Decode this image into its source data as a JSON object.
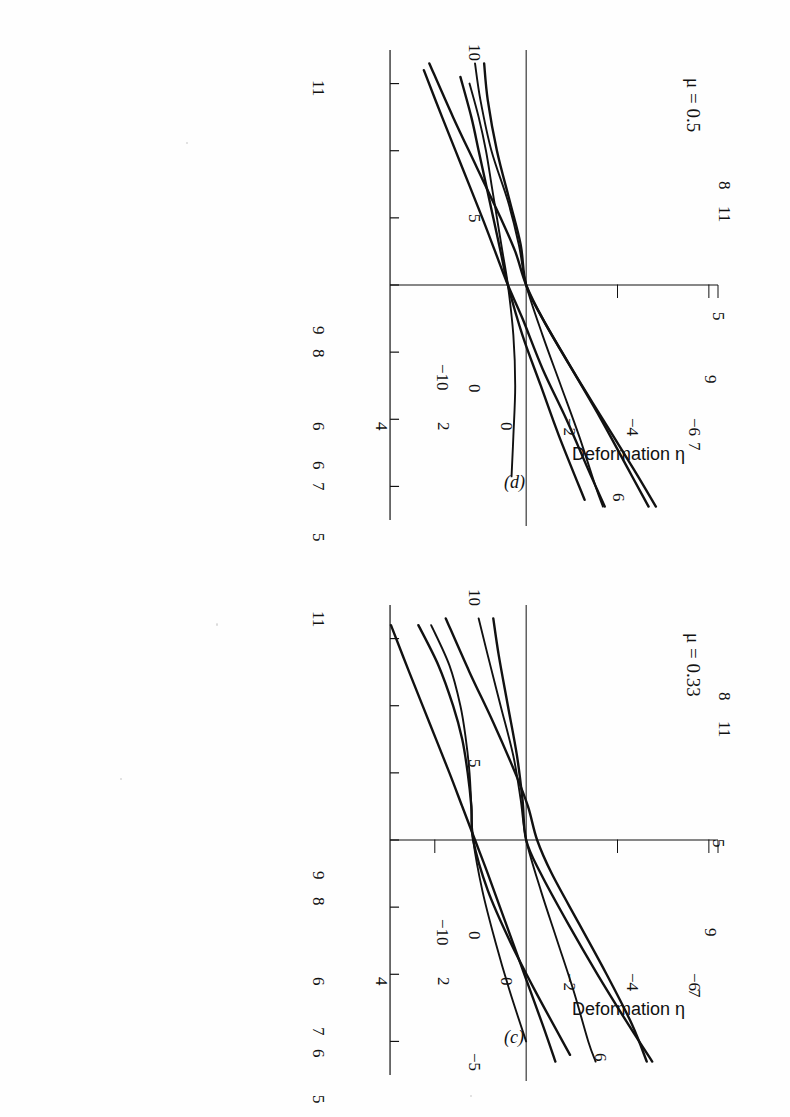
{
  "figure": {
    "orientation": "rotated-90-ccw",
    "background_color": "#fefefe",
    "ink_color": "#111111",
    "panels": [
      "c",
      "d"
    ]
  },
  "panel_c": {
    "tag": "(c)",
    "mu_label": "μ = 0.33",
    "xaxis_title": "Deformation η",
    "y_tick_labels": [
      "10",
      "5",
      "0",
      "−5"
    ],
    "x_tick_labels": [
      "−6",
      "−4",
      "−2",
      "0",
      "2",
      "4",
      "6"
    ],
    "y_minus_ten_label": "−10",
    "curve_labels_left": [
      "11",
      "9",
      "8",
      "7",
      "6",
      "5"
    ],
    "curve_labels_right": [
      "8",
      "11",
      "5",
      "9",
      "7",
      "6"
    ]
  },
  "panel_d": {
    "tag": "(d)",
    "mu_label": "μ = 0.5",
    "xaxis_title": "Deformation η",
    "y_tick_labels": [
      "10",
      "5",
      "0"
    ],
    "x_tick_labels": [
      "−6",
      "−4",
      "−2",
      "0",
      "2",
      "4",
      "6"
    ],
    "y_minus_ten_label": "−10",
    "curve_labels_left": [
      "11",
      "9",
      "8",
      "6",
      "7",
      "5"
    ],
    "curve_labels_right": [
      "8",
      "11",
      "5",
      "9",
      "7",
      "6"
    ]
  },
  "chart_data": [
    {
      "type": "line",
      "id": "panel_c",
      "title": "μ = 0.33",
      "xlabel": "Deformation η",
      "ylabel": "",
      "xlim": [
        -7.0,
        7.0
      ],
      "ylim": [
        -8.0,
        10.5
      ],
      "xticks": [
        -6,
        -4,
        -2,
        0,
        2,
        4,
        6
      ],
      "yticks": [
        -5,
        0,
        5,
        10
      ],
      "grid": false,
      "legend": "inline-curve-labels",
      "series": [
        {
          "name": "5",
          "x": [
            -6.4,
            -5.0,
            -3.5,
            -2.0,
            -1.0,
            0.0,
            1.0,
            2.5,
            4.0,
            5.5,
            6.6
          ],
          "y": [
            -7.4,
            -6.4,
            -5.3,
            -4.2,
            -3.5,
            -2.8,
            -2.1,
            -1.1,
            -0.1,
            0.9,
            1.6
          ]
        },
        {
          "name": "6",
          "x": [
            -6.4,
            -5.2,
            -4.0,
            -3.0,
            -2.0,
            -1.0,
            0.0,
            1.5,
            3.0,
            4.5,
            6.0
          ],
          "y": [
            -5.2,
            -4.2,
            -3.6,
            -3.3,
            -3.1,
            -3.0,
            -2.9,
            -2.4,
            -1.7,
            -0.9,
            0.0
          ]
        },
        {
          "name": "7",
          "x": [
            -6.4,
            -5.2,
            -4.0,
            -3.0,
            -2.0,
            -1.0,
            0.0,
            1.5,
            3.0,
            4.5,
            6.4
          ],
          "y": [
            -5.9,
            -4.8,
            -4.0,
            -3.5,
            -3.2,
            -3.0,
            -2.9,
            -2.1,
            -0.9,
            0.5,
            2.4
          ]
        },
        {
          "name": "8",
          "x": [
            -6.6,
            -5.5,
            -4.0,
            -2.5,
            -1.2,
            0.0,
            1.0,
            2.5,
            4.0,
            5.5,
            6.6
          ],
          "y": [
            -1.8,
            -1.5,
            -1.0,
            -0.5,
            -0.2,
            0.0,
            0.8,
            2.3,
            3.9,
            5.6,
            6.9
          ]
        },
        {
          "name": "9",
          "x": [
            -6.6,
            -5.5,
            -4.0,
            -2.5,
            -1.2,
            0.0,
            1.5,
            3.0,
            4.5,
            6.0,
            6.6
          ],
          "y": [
            -2.6,
            -2.1,
            -1.4,
            -0.7,
            -0.3,
            0.0,
            0.8,
            1.7,
            2.6,
            3.4,
            3.8
          ]
        },
        {
          "name": "11",
          "x": [
            -6.6,
            -5.0,
            -3.5,
            -2.0,
            -1.0,
            0.0,
            1.0,
            2.5,
            4.0,
            5.5,
            6.6
          ],
          "y": [
            -4.4,
            -3.1,
            -1.8,
            -0.6,
            0.1,
            0.6,
            1.4,
            2.9,
            4.4,
            5.8,
            6.6
          ]
        }
      ]
    },
    {
      "type": "line",
      "id": "panel_d",
      "title": "μ = 0.5",
      "xlabel": "Deformation η",
      "ylabel": "",
      "xlim": [
        -7.0,
        7.0
      ],
      "ylim": [
        -8.0,
        10.5
      ],
      "xticks": [
        -6,
        -4,
        -2,
        0,
        2,
        4,
        6
      ],
      "yticks": [
        0,
        5,
        10
      ],
      "grid": false,
      "legend": "inline-curve-labels",
      "series": [
        {
          "name": "5",
          "x": [
            -6.4,
            -5.0,
            -3.5,
            -2.0,
            -1.0,
            0.0,
            1.0,
            2.5,
            4.0,
            5.5,
            6.6
          ],
          "y": [
            -5.6,
            -4.6,
            -3.5,
            -2.4,
            -1.7,
            -1.0,
            -0.2,
            0.9,
            2.2,
            3.4,
            4.3
          ]
        },
        {
          "name": "6",
          "x": [
            -6.0,
            -5.0,
            -4.0,
            -3.0,
            -2.0,
            -1.0,
            0.0,
            1.5,
            3.0,
            4.5,
            5.7
          ],
          "y": [
            -3.1,
            -2.6,
            -2.2,
            -1.9,
            -1.6,
            -1.3,
            -1.0,
            -0.7,
            -0.6,
            -0.7,
            -0.8
          ]
        },
        {
          "name": "7",
          "x": [
            -6.2,
            -5.0,
            -4.0,
            -3.0,
            -2.0,
            -1.0,
            0.0,
            1.5,
            3.0,
            4.5,
            6.4
          ],
          "y": [
            -3.6,
            -3.0,
            -2.6,
            -2.2,
            -1.8,
            -1.4,
            -1.0,
            -0.2,
            0.8,
            1.8,
            3.2
          ]
        },
        {
          "name": "8",
          "x": [
            -6.6,
            -5.5,
            -4.0,
            -2.5,
            -1.2,
            0.0,
            1.0,
            2.5,
            4.0,
            5.5,
            6.6
          ],
          "y": [
            -2.3,
            -2.1,
            -1.6,
            -0.9,
            -0.3,
            0.0,
            0.9,
            2.5,
            4.2,
            5.9,
            7.1
          ]
        },
        {
          "name": "9",
          "x": [
            -6.6,
            -5.5,
            -4.0,
            -2.5,
            -1.2,
            0.0,
            1.5,
            3.0,
            4.5,
            6.0,
            6.6
          ],
          "y": [
            -2.8,
            -2.5,
            -1.9,
            -1.0,
            -0.4,
            0.0,
            0.9,
            1.9,
            2.9,
            3.8,
            4.2
          ]
        },
        {
          "name": "11",
          "x": [
            -6.6,
            -5.0,
            -3.5,
            -2.0,
            -1.0,
            0.0,
            1.0,
            2.5,
            4.0,
            5.5,
            6.6
          ],
          "y": [
            -5.3,
            -4.0,
            -2.7,
            -1.4,
            -0.6,
            0.0,
            0.9,
            2.5,
            4.1,
            5.6,
            6.7
          ]
        }
      ]
    }
  ]
}
